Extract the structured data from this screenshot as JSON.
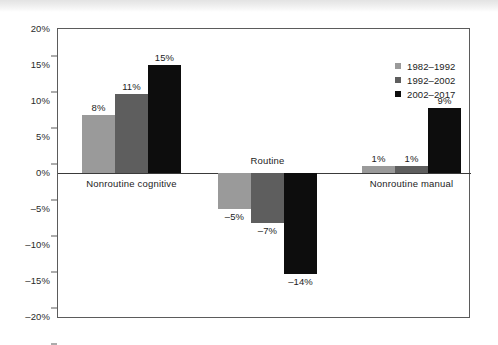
{
  "chart_data": {
    "type": "bar",
    "title": "",
    "subtitle": "",
    "xlabel": "",
    "ylabel": "",
    "categories": [
      "Nonroutine cognitive",
      "Routine",
      "Nonroutine manual"
    ],
    "series": [
      {
        "name": "1982–1992",
        "color": "#9a9a9a",
        "values": [
          8,
          -5,
          1
        ],
        "labels": [
          "8%",
          "–5%",
          "1%"
        ]
      },
      {
        "name": "1992–2002",
        "color": "#5e5e5e",
        "values": [
          11,
          -7,
          1
        ],
        "labels": [
          "11%",
          "–7%",
          "1%"
        ]
      },
      {
        "name": "2002–2017",
        "color": "#0d0d0d",
        "values": [
          15,
          -14,
          9
        ],
        "labels": [
          "15%",
          "–14%",
          "9%"
        ]
      }
    ],
    "ylim": [
      -20,
      20
    ],
    "ytick_labels": [
      "20%",
      "15%",
      "10%",
      "5%",
      "0%",
      "–5%",
      "–10%",
      "–15%",
      "–20%"
    ],
    "ytick_values": [
      20,
      15,
      10,
      5,
      0,
      -5,
      -10,
      -15,
      -20
    ],
    "grid": false,
    "legend_position": "top-right",
    "zero_line": true,
    "frame_color": "#5b5b5b",
    "background": "#ffffff"
  },
  "legend": {
    "items": [
      {
        "label": "1982–1992",
        "color": "#9a9a9a"
      },
      {
        "label": "1992–2002",
        "color": "#5e5e5e"
      },
      {
        "label": "2002–2017",
        "color": "#0d0d0d"
      }
    ]
  }
}
